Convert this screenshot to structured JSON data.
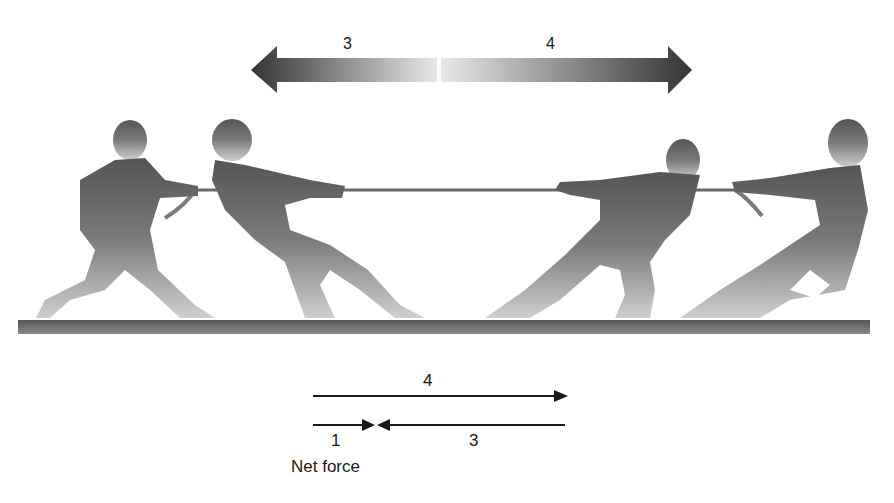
{
  "diagram": {
    "type": "force-diagram",
    "top_arrow": {
      "left_label": "3",
      "right_label": "4",
      "left_direction": "left",
      "right_direction": "right"
    },
    "figures": [
      {
        "team": "left",
        "position": "back"
      },
      {
        "team": "left",
        "position": "front"
      },
      {
        "team": "right",
        "position": "front"
      },
      {
        "team": "right",
        "position": "back"
      }
    ],
    "vector_diagram": {
      "rightward_force": {
        "label": "4",
        "direction": "right"
      },
      "net_force": {
        "label": "1",
        "direction": "right"
      },
      "leftward_force": {
        "label": "3",
        "direction": "left"
      },
      "caption": "Net force"
    },
    "colors": {
      "arrow_dark": "#3a3a3a",
      "arrow_light": "#e6e6e6",
      "figure_dark": "#5a5a5a",
      "figure_light": "#c4c4c4",
      "ground": "#6e6e6e",
      "line": "#1a1a1a"
    }
  }
}
